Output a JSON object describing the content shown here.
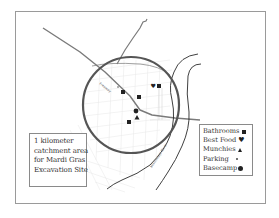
{
  "map": {
    "caption": {
      "lines": [
        "1 kilometer",
        "catchment area",
        "for Mardi Gras",
        "Excavation Site"
      ]
    },
    "road_label": "Freeway",
    "river_label": "Mississippi River",
    "catchment": {
      "radius_label": "1 kilometer",
      "center": [
        131,
        105
      ],
      "radius_px": 48
    },
    "colors": {
      "frame": "#9a9a9a",
      "circle": "#555555",
      "road": "#777777",
      "river": "#333333",
      "streets": "#e4e4e4",
      "symbols": "#222222"
    },
    "legend": {
      "items": [
        {
          "label": "Bathrooms",
          "icon": "square-icon"
        },
        {
          "label": "Best Food",
          "icon": "heart-icon"
        },
        {
          "label": "Munchies",
          "icon": "triangle-icon"
        },
        {
          "label": "Parking",
          "icon": "dot-icon"
        },
        {
          "label": "Basecamp",
          "icon": "filled-circle-icon"
        }
      ]
    },
    "markers": [
      {
        "type": "bathrooms",
        "x": 123,
        "y": 92
      },
      {
        "type": "bathrooms",
        "x": 139,
        "y": 97
      },
      {
        "type": "bathrooms",
        "x": 159,
        "y": 86
      },
      {
        "type": "bathrooms",
        "x": 129,
        "y": 122
      },
      {
        "type": "best_food",
        "x": 153,
        "y": 85
      },
      {
        "type": "munchies",
        "x": 137,
        "y": 118
      },
      {
        "type": "parking",
        "x": 118,
        "y": 87
      },
      {
        "type": "basecamp",
        "x": 136,
        "y": 111
      }
    ]
  }
}
